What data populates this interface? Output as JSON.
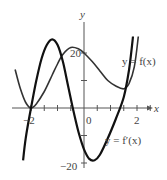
{
  "chart_data": {
    "type": "line",
    "title": "",
    "xlabel": "x",
    "ylabel": "y",
    "xlim": [
      -2.6,
      2.7
    ],
    "ylim": [
      -20,
      28
    ],
    "x_ticks": [
      -2,
      -1.5,
      -1,
      -0.5,
      0,
      0.5,
      1,
      1.5,
      2,
      2.5
    ],
    "x_tick_labels": [
      "-2",
      "0",
      "2"
    ],
    "y_ticks": [
      -20,
      -10,
      0,
      10,
      20
    ],
    "y_tick_labels": [
      "20",
      "-20"
    ],
    "grid": false,
    "series": [
      {
        "name": "y = f(x)",
        "style": "thin",
        "x": [
          -2.6,
          -2.4,
          -2.2,
          -2.0,
          -1.8,
          -1.5,
          -1.2,
          -1.0,
          -0.8,
          -0.5,
          -0.2,
          0.0,
          0.3,
          0.6,
          0.9,
          1.2,
          1.5,
          1.7,
          1.9,
          2.05
        ],
        "y": [
          14,
          7,
          2,
          0,
          1.5,
          6,
          12,
          16,
          19.5,
          22,
          21.5,
          20,
          17,
          13.5,
          10,
          8,
          7,
          9,
          15,
          26
        ]
      },
      {
        "name": "y = f'(x)",
        "style": "thick",
        "x": [
          -2.3,
          -2.2,
          -2.0,
          -1.8,
          -1.6,
          -1.4,
          -1.2,
          -1.0,
          -0.8,
          -0.6,
          -0.4,
          -0.2,
          0.0,
          0.2,
          0.4,
          0.6,
          0.9,
          1.2,
          1.5,
          1.7,
          1.85
        ],
        "y": [
          -19,
          -11,
          0,
          10,
          18,
          23,
          25,
          23,
          17,
          8,
          -1,
          -9,
          -15,
          -18.5,
          -19,
          -17,
          -11,
          -4,
          4,
          14,
          26
        ]
      }
    ],
    "annotations": [
      {
        "text": "y = f(x)",
        "near_x": 2.0,
        "near_y": 14
      },
      {
        "text": "y = f'(x)",
        "near_x": 1.3,
        "near_y": -10
      }
    ]
  },
  "labels": {
    "x_axis": "x",
    "y_axis": "y",
    "x_neg2": "−2",
    "x_0": "0",
    "x_2": "2",
    "y_20": "20",
    "y_neg20": "−20",
    "f_label": "y = f(x)",
    "fp_label": "y = f′(x)"
  }
}
